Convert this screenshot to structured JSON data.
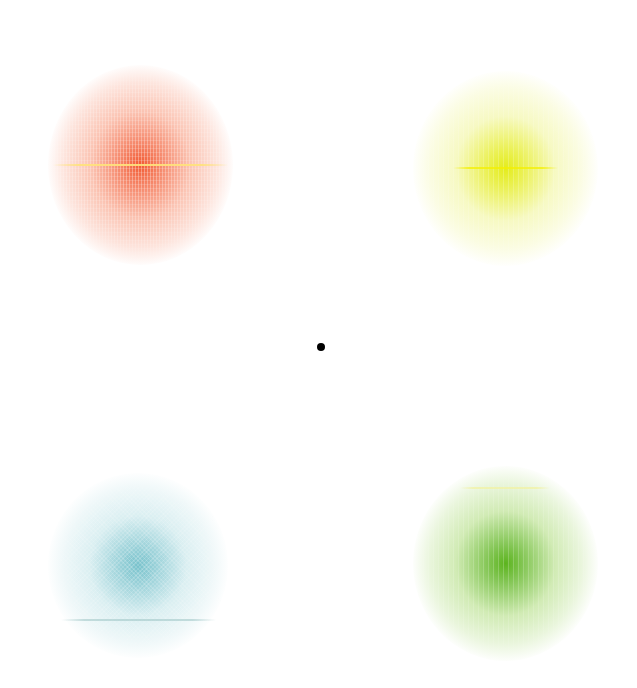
{
  "canvas": {
    "width": 637,
    "height": 688,
    "background": "#ffffff"
  },
  "fixation": {
    "icon": "dot-icon",
    "color": "#000000",
    "x": 321,
    "y": 347,
    "size": 8
  },
  "targets": [
    {
      "id": "red",
      "color_center": "#f25a32",
      "color_mid": "#f9a48a",
      "texture": "vertical-grid",
      "cx": 140,
      "cy": 165,
      "w": 185,
      "h": 200,
      "line": {
        "color": "#ffe27a",
        "y_offset": 0,
        "width": 175,
        "opacity": 0.9
      }
    },
    {
      "id": "yellow",
      "color_center": "#e4ec1c",
      "color_mid": "#f2f6a2",
      "texture": "faint-vertical",
      "cx": 505,
      "cy": 168,
      "w": 185,
      "h": 195,
      "line": {
        "color": "#f4f000",
        "y_offset": 0,
        "width": 105,
        "opacity": 0.75
      }
    },
    {
      "id": "cyan",
      "color_center": "#78c2cc",
      "color_mid": "#c6e6ea",
      "texture": "dither",
      "cx": 138,
      "cy": 565,
      "w": 180,
      "h": 185,
      "line": {
        "color": "#9cc4c4",
        "y_offset": 55,
        "width": 155,
        "opacity": 0.55
      }
    },
    {
      "id": "green",
      "color_center": "#5cb41e",
      "color_mid": "#b8e08c",
      "texture": "faint-vertical",
      "cx": 505,
      "cy": 563,
      "w": 185,
      "h": 195,
      "line": {
        "color": "#f2f2a0",
        "y_offset": -75,
        "width": 90,
        "opacity": 0.7
      }
    }
  ]
}
